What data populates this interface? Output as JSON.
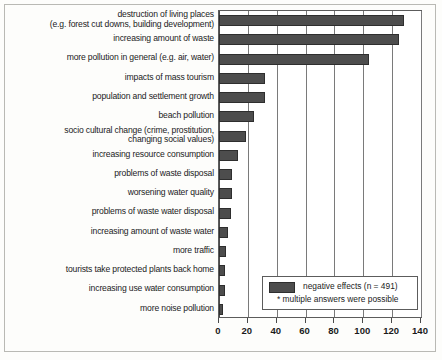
{
  "chart_data": {
    "type": "bar",
    "orientation": "horizontal",
    "title": "",
    "subtitle": "",
    "xlabel": "",
    "ylabel": "",
    "xlim": [
      0,
      140
    ],
    "xticks": [
      0,
      20,
      40,
      60,
      80,
      100,
      120,
      140
    ],
    "grid": true,
    "legend_position": "inside-bottom-right",
    "series_name": "negative effects (n = 491)",
    "footnote": "* multiple answers were possible",
    "categories": [
      "destruction of living places",
      "increasing amount of waste",
      "more pollution in general (e.g. air, water)",
      "impacts of mass tourism",
      "population and settlement growth",
      "beach pollution",
      "socio cultural change (crime, prostitution, changing social values)",
      "increasing resource consumption",
      "problems of waste disposal",
      "worsening water quality",
      "problems of waste water disposal",
      "increasing amount of waste water",
      "more traffic",
      "tourists take protected plants back home",
      "increasing use water consumption",
      "more noise pollution"
    ],
    "values": [
      128,
      125,
      104,
      32,
      32,
      24,
      19,
      13,
      9,
      9,
      8,
      6,
      5,
      4,
      4,
      3
    ]
  },
  "labels": [
    {
      "line1": "destruction of living places",
      "line2": "(e.g. forest cut downs, building development)"
    },
    {
      "line1": "increasing amount of waste",
      "line2": ""
    },
    {
      "line1": "more pollution in general (e.g. air, water)",
      "line2": ""
    },
    {
      "line1": "impacts of mass tourism",
      "line2": ""
    },
    {
      "line1": "population and settlement growth",
      "line2": ""
    },
    {
      "line1": "beach pollution",
      "line2": ""
    },
    {
      "line1": "socio cultural change (crime, prostitution,",
      "line2": "changing social values)"
    },
    {
      "line1": "increasing resource consumption",
      "line2": ""
    },
    {
      "line1": "problems of waste disposal",
      "line2": ""
    },
    {
      "line1": "worsening water quality",
      "line2": ""
    },
    {
      "line1": "problems of waste water disposal",
      "line2": ""
    },
    {
      "line1": "increasing amount of waste water",
      "line2": ""
    },
    {
      "line1": "more traffic",
      "line2": ""
    },
    {
      "line1": "tourists take protected plants back home",
      "line2": ""
    },
    {
      "line1": "increasing use water consumption",
      "line2": ""
    },
    {
      "line1": "more noise pollution",
      "line2": ""
    }
  ],
  "legend": {
    "series_label": "negative effects  (n = 491)",
    "note_label": "*  multiple answers were possible"
  },
  "colors": {
    "bar_fill": "#4d4d4d",
    "bar_stroke": "#2e2e2e",
    "axis": "#5c5c5c",
    "grid": "#7a7a7a",
    "text": "#1b1b1b",
    "background": "#fdfdfb"
  }
}
